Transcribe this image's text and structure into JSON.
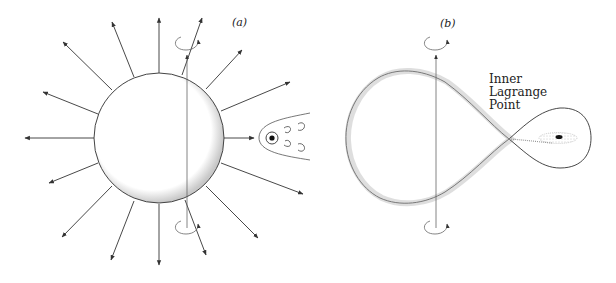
{
  "panels": [
    {
      "id": "a",
      "label": "(a)",
      "description": "Single star with radial stellar wind and rotation axis; companion with accretion wake",
      "elements": [
        "star",
        "radial-wind-arrows",
        "rotation-axis",
        "rotation-arrows",
        "companion-star",
        "wake-eddies"
      ]
    },
    {
      "id": "b",
      "label": "(b)",
      "description": "Roche-lobe filling star transferring mass through inner Lagrange point to companion with accretion disk",
      "annotation": [
        "Inner",
        "Lagrange",
        "Point"
      ],
      "elements": [
        "roche-lobe-primary",
        "roche-lobe-secondary",
        "rotation-axis",
        "rotation-arrows",
        "accretion-stream",
        "accretion-disk"
      ]
    }
  ],
  "colors": {
    "line": "#333333",
    "stipple": "#9a9a9a",
    "background": "#ffffff"
  }
}
